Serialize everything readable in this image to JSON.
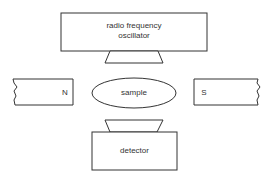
{
  "diagram": {
    "type": "NMR spectrometer schematic",
    "oscillator": {
      "label_line1": "radio frequency",
      "label_line2": "oscillator"
    },
    "magnet_north": {
      "label": "N"
    },
    "magnet_south": {
      "label": "S"
    },
    "sample": {
      "label": "sample"
    },
    "detector": {
      "label": "detector"
    }
  },
  "colors": {
    "stroke": "#333333",
    "background": "#ffffff"
  }
}
